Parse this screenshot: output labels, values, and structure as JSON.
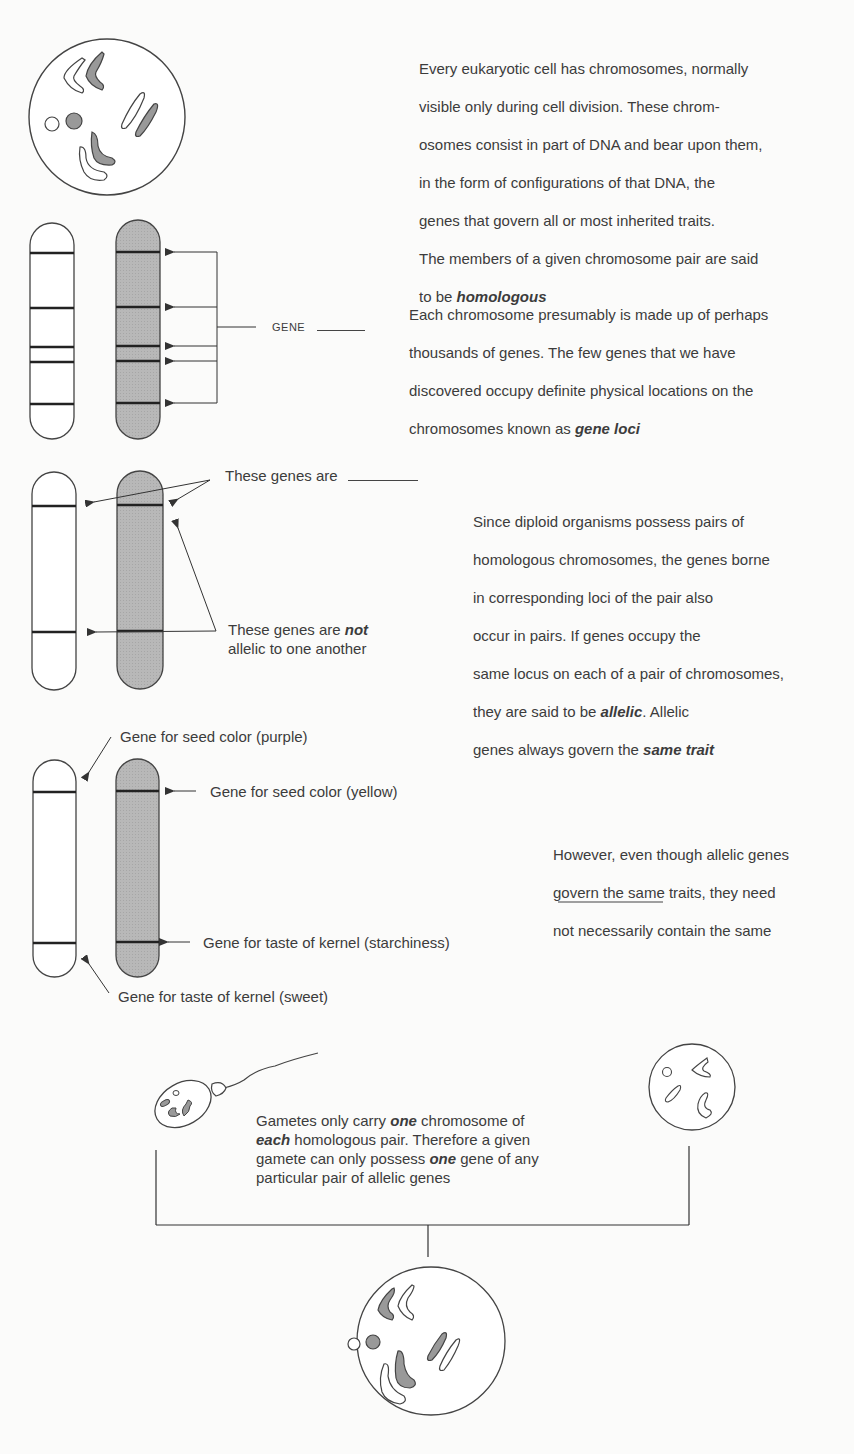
{
  "sections": {
    "cell": {
      "text_lines": [
        "Every eukaryotic cell has chromosomes, normally",
        "visible only during cell division.  These chrom-",
        "osomes consist in part of DNA and bear upon them,",
        "in the form of configurations of that DNA, the",
        "genes that govern all or most inherited traits.",
        "The members of a given chromosome pair are said"
      ],
      "last_line_prefix": "to be ",
      "last_line_emphasis": "homologous"
    },
    "gene_loci": {
      "gene_label": "GENE",
      "text_lines": [
        "Each chromosome presumably is made up of perhaps",
        "thousands of genes.  The few genes that we have",
        "discovered occupy definite physical locations on the"
      ],
      "last_line_prefix": "chromosomes known as ",
      "last_line_emphasis": "gene loci"
    },
    "allelic": {
      "label_top": "These genes are",
      "label_bottom_prefix": "These genes are ",
      "label_bottom_emphasis": "not",
      "label_bottom_line2": "allelic to one another",
      "text_lines": [
        "Since diploid organisms possess pairs of",
        "homologous chromosomes, the genes borne",
        "in corresponding loci of the pair also",
        "occur in pairs.  If genes occupy the",
        "same locus on each of a pair of chromosomes,"
      ],
      "line6_prefix": "they are said to be ",
      "line6_emphasis": "allelic",
      "line6_suffix": ".  Allelic",
      "line7_prefix": "genes always govern the ",
      "line7_emphasis": "same trait"
    },
    "traits": {
      "label_purple": "Gene for seed color (purple)",
      "label_yellow": "Gene for seed color (yellow)",
      "label_starch": "Gene for taste of kernel (starchiness)",
      "label_sweet": "Gene for taste of kernel (sweet)",
      "text_lines": [
        "However, even though allelic genes",
        "govern the same traits, they need",
        "not necessarily contain the same"
      ]
    },
    "gametes": {
      "line1_prefix": "Gametes only carry ",
      "line1_emphasis": "one",
      "line1_suffix": " chromosome of",
      "line2_emphasis": "each",
      "line2_suffix": " homologous pair.  Therefore a given",
      "line3_prefix": "gamete can only possess ",
      "line3_emphasis": "one",
      "line3_suffix": " gene of any",
      "line4": "particular pair of allelic genes"
    }
  },
  "colors": {
    "background": "#fbfbfa",
    "ink": "#3c3c3c",
    "shaded_chromosome": "#b4b4b4"
  }
}
